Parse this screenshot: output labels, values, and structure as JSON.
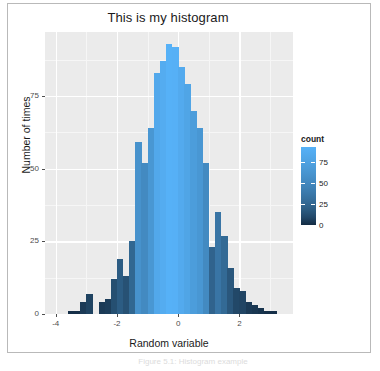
{
  "figure": {
    "title": "This is my histogram",
    "caption": "Figure 5.1: Histogram example",
    "panel_bg": "#ebebeb",
    "grid_color": "#ffffff",
    "frame_color": "#b9b9b9"
  },
  "axes": {
    "x": {
      "label": "Random variable",
      "ticks": [
        -4,
        -2,
        0,
        2
      ],
      "tick_labels": [
        "-4",
        "-2",
        "0",
        "2"
      ],
      "limits": [
        -4.35,
        3.75
      ]
    },
    "y": {
      "label": "Number of times",
      "ticks": [
        0,
        25,
        50,
        75
      ],
      "tick_labels": [
        "0",
        "25",
        "50",
        "75"
      ],
      "limits": [
        0,
        97
      ]
    }
  },
  "legend": {
    "title": "count",
    "ticks": [
      0,
      25,
      50,
      75
    ],
    "tick_labels": [
      "0",
      "25",
      "50",
      "75"
    ],
    "limits": [
      0,
      93
    ],
    "gradient_low": "#132b43",
    "gradient_high": "#56b1f7",
    "position": "right"
  },
  "chart_data": {
    "type": "bar",
    "title": "This is my histogram",
    "xlabel": "Random variable",
    "ylabel": "Number of times",
    "xlim": [
      -4.35,
      3.75
    ],
    "ylim": [
      0,
      97
    ],
    "grid": true,
    "legend_title": "count",
    "legend_position": "right",
    "bin_width": 0.2,
    "x": [
      -3.5,
      -3.3,
      -3.1,
      -2.9,
      -2.7,
      -2.5,
      -2.3,
      -2.1,
      -1.9,
      -1.7,
      -1.5,
      -1.3,
      -1.1,
      -0.9,
      -0.7,
      -0.5,
      -0.3,
      -0.1,
      0.1,
      0.3,
      0.5,
      0.7,
      0.9,
      1.1,
      1.3,
      1.5,
      1.7,
      1.9,
      2.1,
      2.3,
      2.5,
      2.7,
      2.9,
      3.1
    ],
    "categories": [
      "-3.5",
      "-3.3",
      "-3.1",
      "-2.9",
      "-2.7",
      "-2.5",
      "-2.3",
      "-2.1",
      "-1.9",
      "-1.7",
      "-1.5",
      "-1.3",
      "-1.1",
      "-0.9",
      "-0.7",
      "-0.5",
      "-0.3",
      "-0.1",
      "0.1",
      "0.3",
      "0.5",
      "0.7",
      "0.9",
      "1.1",
      "1.3",
      "1.5",
      "1.7",
      "1.9",
      "2.1",
      "2.3",
      "2.5",
      "2.7",
      "2.9",
      "3.1"
    ],
    "values": [
      1,
      1,
      4,
      7,
      0,
      4,
      5,
      12,
      19,
      13,
      25,
      59,
      52,
      64,
      83,
      87,
      93,
      92,
      85,
      79,
      70,
      64,
      52,
      23,
      35,
      27,
      16,
      9,
      8,
      4,
      3,
      2,
      1,
      1
    ]
  }
}
